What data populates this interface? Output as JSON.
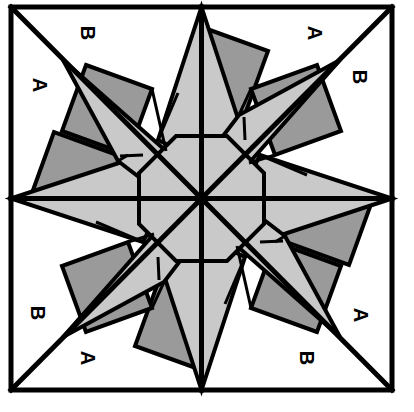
{
  "figure": {
    "type": "geometric-diagram",
    "canvas": {
      "width": 414,
      "height": 412
    },
    "colors": {
      "background": "#ffffff",
      "stroke": "#000000",
      "star_light_gray": "#c9c9c9",
      "square_dark_gray": "#9a9a9a",
      "center_octagon_gray": "#c9c9c9",
      "white_fill": "#ffffff"
    },
    "frame": {
      "name": "outer-square-border",
      "x": 11,
      "y": 7,
      "width": 381,
      "height": 383,
      "stroke_width": 5
    },
    "center": {
      "x": 201.5,
      "y": 198.5
    },
    "radii": {
      "inner_octagon": 62,
      "star_outer_point": 192,
      "square_ring_inner": 70,
      "square_ring_outer": 150
    },
    "construction_lines": [
      {
        "name": "horizontal-axis",
        "x1": 11,
        "y1": 198.5,
        "x2": 392,
        "y2": 198.5
      },
      {
        "name": "vertical-axis",
        "x1": 201.5,
        "y1": 7,
        "x2": 201.5,
        "y2": 390
      },
      {
        "name": "diagonal-nw-se",
        "x1": 11,
        "y1": 7,
        "x2": 392,
        "y2": 390
      },
      {
        "name": "diagonal-ne-sw",
        "x1": 392,
        "y1": 7,
        "x2": 11,
        "y2": 390
      }
    ],
    "labels": [
      {
        "id": "label-b-top-left",
        "text": "B",
        "x": 88,
        "y": 33,
        "rotation": 90
      },
      {
        "id": "label-a-top-right",
        "text": "A",
        "x": 315,
        "y": 33,
        "rotation": 90
      },
      {
        "id": "label-a-left-top",
        "text": "A",
        "x": 40,
        "y": 85,
        "rotation": 90
      },
      {
        "id": "label-b-right-top",
        "text": "B",
        "x": 360,
        "y": 77,
        "rotation": 90
      },
      {
        "id": "label-b-left-bottom",
        "text": "B",
        "x": 38,
        "y": 313,
        "rotation": 90
      },
      {
        "id": "label-a-right-bottom",
        "text": "A",
        "x": 361,
        "y": 315,
        "rotation": 90
      },
      {
        "id": "label-a-bottom-left",
        "text": "A",
        "x": 88,
        "y": 358,
        "rotation": 90
      },
      {
        "id": "label-b-bottom-right",
        "text": "B",
        "x": 307,
        "y": 358,
        "rotation": 90
      }
    ],
    "label_summary": {
      "letters_used": [
        "A",
        "B"
      ],
      "count_a": 4,
      "count_b": 4,
      "total": 8
    },
    "star": {
      "points": 8,
      "description": "Eight-pointed star with alternating long points on the axes and diagonals"
    },
    "squares": {
      "count": 8,
      "description": "Eight tilted dark gray squares arranged in a ring between the star points"
    }
  }
}
